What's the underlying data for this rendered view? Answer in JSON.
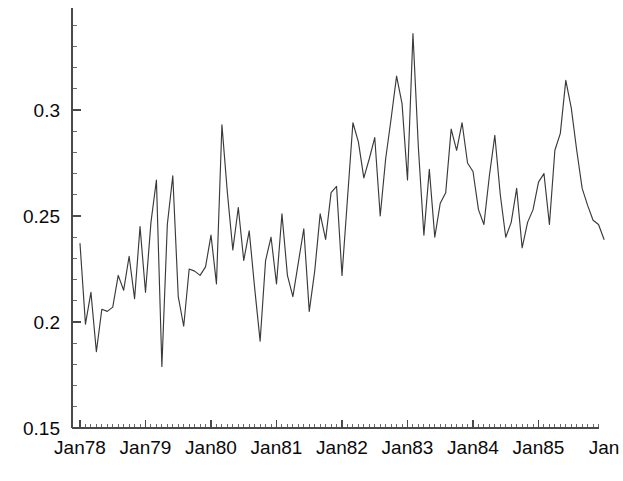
{
  "chart_data": {
    "type": "line",
    "title": "",
    "subtitle": "",
    "xlabel": "",
    "ylabel": "",
    "xlim": [
      "Jan78",
      "Jan86"
    ],
    "ylim": [
      0.15,
      0.34
    ],
    "grid": false,
    "legend": null,
    "y_ticks_major": [
      0.15,
      0.2,
      0.25,
      0.3
    ],
    "y_tick_labels": [
      "0.15",
      "0.2",
      "0.25",
      "0.3"
    ],
    "y_minor_tick_step": 0.01,
    "x_tick_labels": [
      "Jan78",
      "Jan79",
      "Jan80",
      "Jan81",
      "Jan82",
      "Jan83",
      "Jan84",
      "Jan85",
      "Jan"
    ],
    "x_minor_tick_step_months": 1,
    "line_color": "#3a3a3a",
    "axis_color": "#4a4a4a",
    "background_color": "#ffffff",
    "x_start_label": "Jan78",
    "points_per_year": 12,
    "series": [
      {
        "name": "series-1",
        "x": [
          "Jan78",
          "Feb78",
          "Mar78",
          "Apr78",
          "May78",
          "Jun78",
          "Jul78",
          "Aug78",
          "Sep78",
          "Oct78",
          "Nov78",
          "Dec78",
          "Jan79",
          "Feb79",
          "Mar79",
          "Apr79",
          "May79",
          "Jun79",
          "Jul79",
          "Aug79",
          "Sep79",
          "Oct79",
          "Nov79",
          "Dec79",
          "Jan80",
          "Feb80",
          "Mar80",
          "Apr80",
          "May80",
          "Jun80",
          "Jul80",
          "Aug80",
          "Sep80",
          "Oct80",
          "Nov80",
          "Dec80",
          "Jan81",
          "Feb81",
          "Mar81",
          "Apr81",
          "May81",
          "Jun81",
          "Jul81",
          "Aug81",
          "Sep81",
          "Oct81",
          "Nov81",
          "Dec81",
          "Jan82",
          "Feb82",
          "Mar82",
          "Apr82",
          "May82",
          "Jun82",
          "Jul82",
          "Aug82",
          "Sep82",
          "Oct82",
          "Nov82",
          "Dec82",
          "Jan83",
          "Feb83",
          "Mar83",
          "Apr83",
          "May83",
          "Jun83",
          "Jul83",
          "Aug83",
          "Sep83",
          "Oct83",
          "Nov83",
          "Dec83",
          "Jan84",
          "Feb84",
          "Mar84",
          "Apr84",
          "May84",
          "Jun84",
          "Jul84",
          "Aug84",
          "Sep84",
          "Oct84",
          "Nov84",
          "Dec84",
          "Jan85",
          "Feb85",
          "Mar85",
          "Apr85",
          "May85",
          "Jun85",
          "Jul85",
          "Aug85",
          "Sep85",
          "Oct85",
          "Nov85",
          "Dec85",
          "Jan86"
        ],
        "values": [
          0.237,
          0.199,
          0.214,
          0.186,
          0.206,
          0.205,
          0.207,
          0.222,
          0.215,
          0.231,
          0.211,
          0.245,
          0.214,
          0.247,
          0.267,
          0.179,
          0.246,
          0.269,
          0.212,
          0.198,
          0.225,
          0.224,
          0.222,
          0.226,
          0.241,
          0.218,
          0.293,
          0.261,
          0.234,
          0.254,
          0.229,
          0.243,
          0.216,
          0.191,
          0.229,
          0.24,
          0.218,
          0.251,
          0.222,
          0.212,
          0.228,
          0.244,
          0.205,
          0.224,
          0.251,
          0.239,
          0.261,
          0.264,
          0.222,
          0.258,
          0.294,
          0.285,
          0.268,
          0.277,
          0.287,
          0.25,
          0.277,
          0.296,
          0.316,
          0.303,
          0.267,
          0.336,
          0.282,
          0.241,
          0.272,
          0.24,
          0.256,
          0.261,
          0.291,
          0.281,
          0.294,
          0.275,
          0.271,
          0.253,
          0.246,
          0.269,
          0.288,
          0.26,
          0.24,
          0.247,
          0.263,
          0.235,
          0.247,
          0.253,
          0.266,
          0.27,
          0.246,
          0.281,
          0.289,
          0.314,
          0.301,
          0.281,
          0.263,
          0.255,
          0.248,
          0.246,
          0.239
        ]
      }
    ]
  },
  "axes": {
    "y_labels": [
      {
        "text": "0.3",
        "value": 0.3
      },
      {
        "text": "0.25",
        "value": 0.25
      },
      {
        "text": "0.2",
        "value": 0.2
      },
      {
        "text": "0.15",
        "value": 0.15
      }
    ],
    "x_labels": [
      {
        "text": "Jan78"
      },
      {
        "text": "Jan79"
      },
      {
        "text": "Jan80"
      },
      {
        "text": "Jan81"
      },
      {
        "text": "Jan82"
      },
      {
        "text": "Jan83"
      },
      {
        "text": "Jan84"
      },
      {
        "text": "Jan85"
      },
      {
        "text": "Jan"
      }
    ]
  }
}
